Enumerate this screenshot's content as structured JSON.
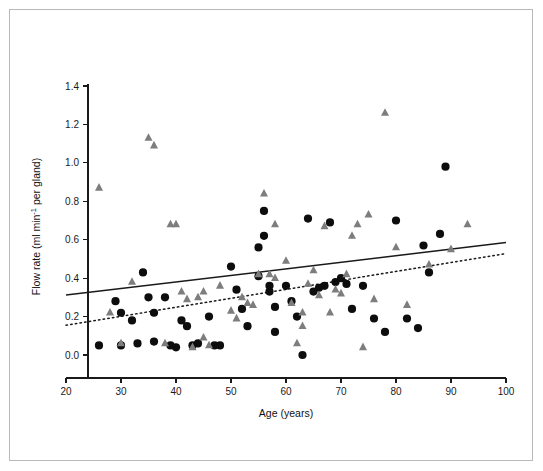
{
  "chart_data": {
    "type": "scatter",
    "title": "",
    "xlabel": "Age (years)",
    "ylabel": "Flow rate (ml min⁻¹ per gland)",
    "ylabel_parts": {
      "pre": "Flow rate (ml min",
      "sup": "-1",
      "post": " per gland)"
    },
    "xlim": [
      20,
      100
    ],
    "ylim": [
      -0.08,
      1.45
    ],
    "xticks": [
      20,
      30,
      40,
      50,
      60,
      70,
      80,
      90,
      100
    ],
    "xticklabels": [
      "20",
      "30",
      "40",
      "50",
      "60",
      "70",
      "80",
      "90",
      "100"
    ],
    "yticks": [
      0.0,
      0.2,
      0.4,
      0.6,
      0.8,
      1.0,
      1.2,
      1.4
    ],
    "yticklabels": [
      "0.0",
      "0.2",
      "0.4",
      "0.6",
      "0.8",
      "1.0",
      "1.2",
      "1.4"
    ],
    "grid": false,
    "legend": "none",
    "colors": {
      "circle_marker": "#0d0d0d",
      "triangle_marker": "#7d7d7d",
      "axis": "#1a1a1a",
      "background": "#ffffff",
      "frame_border": "#b9b9b9"
    },
    "series": [
      {
        "name": "circles",
        "marker": "circle",
        "color": "#0d0d0d",
        "points": [
          [
            26,
            0.05
          ],
          [
            29,
            0.28
          ],
          [
            30,
            0.22
          ],
          [
            30,
            0.05
          ],
          [
            32,
            0.18
          ],
          [
            33,
            0.06
          ],
          [
            34,
            0.43
          ],
          [
            35,
            0.3
          ],
          [
            36,
            0.22
          ],
          [
            36,
            0.07
          ],
          [
            38,
            0.3
          ],
          [
            39,
            0.05
          ],
          [
            40,
            0.04
          ],
          [
            41,
            0.18
          ],
          [
            42,
            0.15
          ],
          [
            43,
            0.05
          ],
          [
            44,
            0.06
          ],
          [
            46,
            0.2
          ],
          [
            47,
            0.05
          ],
          [
            48,
            0.05
          ],
          [
            50,
            0.46
          ],
          [
            51,
            0.34
          ],
          [
            52,
            0.24
          ],
          [
            53,
            0.15
          ],
          [
            55,
            0.56
          ],
          [
            55,
            0.41
          ],
          [
            56,
            0.75
          ],
          [
            56,
            0.62
          ],
          [
            57,
            0.36
          ],
          [
            57,
            0.33
          ],
          [
            58,
            0.25
          ],
          [
            58,
            0.12
          ],
          [
            60,
            0.36
          ],
          [
            61,
            0.28
          ],
          [
            62,
            0.2
          ],
          [
            63,
            0.0
          ],
          [
            64,
            0.71
          ],
          [
            65,
            0.33
          ],
          [
            66,
            0.35
          ],
          [
            67,
            0.36
          ],
          [
            68,
            0.69
          ],
          [
            69,
            0.38
          ],
          [
            70,
            0.4
          ],
          [
            71,
            0.37
          ],
          [
            72,
            0.24
          ],
          [
            74,
            0.36
          ],
          [
            76,
            0.19
          ],
          [
            78,
            0.12
          ],
          [
            80,
            0.7
          ],
          [
            82,
            0.19
          ],
          [
            84,
            0.14
          ],
          [
            85,
            0.57
          ],
          [
            86,
            0.43
          ],
          [
            88,
            0.63
          ],
          [
            89,
            0.98
          ]
        ]
      },
      {
        "name": "triangles",
        "marker": "triangle",
        "color": "#7d7d7d",
        "points": [
          [
            26,
            0.87
          ],
          [
            28,
            0.22
          ],
          [
            30,
            0.06
          ],
          [
            32,
            0.38
          ],
          [
            35,
            1.13
          ],
          [
            36,
            1.09
          ],
          [
            38,
            0.06
          ],
          [
            39,
            0.68
          ],
          [
            40,
            0.68
          ],
          [
            41,
            0.33
          ],
          [
            42,
            0.29
          ],
          [
            43,
            0.04
          ],
          [
            44,
            0.3
          ],
          [
            45,
            0.33
          ],
          [
            45,
            0.09
          ],
          [
            46,
            0.05
          ],
          [
            48,
            0.36
          ],
          [
            50,
            0.23
          ],
          [
            51,
            0.19
          ],
          [
            52,
            0.3
          ],
          [
            53,
            0.27
          ],
          [
            54,
            0.26
          ],
          [
            55,
            0.42
          ],
          [
            56,
            0.84
          ],
          [
            57,
            0.42
          ],
          [
            58,
            0.68
          ],
          [
            58,
            0.4
          ],
          [
            60,
            0.49
          ],
          [
            61,
            0.27
          ],
          [
            62,
            0.06
          ],
          [
            63,
            0.22
          ],
          [
            63,
            0.15
          ],
          [
            64,
            0.37
          ],
          [
            65,
            0.44
          ],
          [
            66,
            0.31
          ],
          [
            67,
            0.67
          ],
          [
            68,
            0.22
          ],
          [
            69,
            0.34
          ],
          [
            70,
            0.32
          ],
          [
            71,
            0.42
          ],
          [
            72,
            0.62
          ],
          [
            73,
            0.68
          ],
          [
            74,
            0.04
          ],
          [
            75,
            0.73
          ],
          [
            76,
            0.29
          ],
          [
            78,
            1.26
          ],
          [
            80,
            0.56
          ],
          [
            82,
            0.26
          ],
          [
            86,
            0.47
          ],
          [
            90,
            0.55
          ],
          [
            93,
            0.68
          ]
        ]
      }
    ],
    "fit_lines": [
      {
        "name": "solid-regression-line",
        "style": "solid",
        "x": [
          20,
          100
        ],
        "y": [
          0.312,
          0.585
        ]
      },
      {
        "name": "dotted-regression-line",
        "style": "dotted",
        "x": [
          20,
          100
        ],
        "y": [
          0.155,
          0.528
        ]
      }
    ]
  }
}
